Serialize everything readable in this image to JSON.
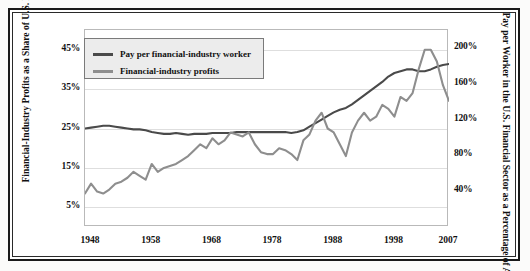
{
  "chart_data": {
    "type": "line",
    "title": "",
    "xlabel": "",
    "ylabel": "Financial-Industry Profits as a Share of U.S. Business Profits",
    "ylabel_right": "Pay per Worker in the U.S. Financial Sector as a Percentage of Average U.S. Compensation",
    "grid": true,
    "legend_position": "top-left",
    "xlim": [
      1947,
      2007
    ],
    "xticks": [
      "1948",
      "1958",
      "1968",
      "1978",
      "1988",
      "1998",
      "2007"
    ],
    "xtick_values": [
      1948,
      1958,
      1968,
      1978,
      1988,
      1998,
      2007
    ],
    "ylim": [
      0,
      50
    ],
    "yticks": [
      "5%",
      "15%",
      "25%",
      "35%",
      "45%"
    ],
    "ytick_values": [
      5,
      15,
      25,
      35,
      45
    ],
    "ylim_right": [
      0,
      220
    ],
    "yticks_right": [
      "40%",
      "80%",
      "120%",
      "160%",
      "200%"
    ],
    "ytick_values_right": [
      40,
      80,
      120,
      160,
      200
    ],
    "series": [
      {
        "name": "Pay per financial-industry worker",
        "axis": "right",
        "color": "#4a4a4a",
        "x": [
          1947,
          1948,
          1949,
          1950,
          1951,
          1952,
          1953,
          1954,
          1955,
          1956,
          1957,
          1958,
          1959,
          1960,
          1961,
          1962,
          1963,
          1964,
          1965,
          1966,
          1967,
          1968,
          1969,
          1970,
          1971,
          1972,
          1973,
          1974,
          1975,
          1976,
          1977,
          1978,
          1979,
          1980,
          1981,
          1982,
          1983,
          1984,
          1985,
          1986,
          1987,
          1988,
          1989,
          1990,
          1991,
          1992,
          1993,
          1994,
          1995,
          1996,
          1997,
          1998,
          1999,
          2000,
          2001,
          2002,
          2003,
          2004,
          2005,
          2006,
          2007
        ],
        "values": [
          110,
          111,
          112,
          113,
          113,
          112,
          111,
          110,
          109,
          109,
          108,
          106,
          105,
          104,
          104,
          105,
          104,
          103,
          104,
          104,
          104,
          105,
          105,
          105,
          105,
          106,
          106,
          106,
          106,
          106,
          106,
          106,
          106,
          106,
          105,
          106,
          108,
          112,
          116,
          120,
          124,
          128,
          131,
          133,
          137,
          142,
          147,
          152,
          157,
          162,
          168,
          172,
          174,
          176,
          176,
          174,
          174,
          176,
          179,
          181,
          182
        ]
      },
      {
        "name": "Financial-industry profits",
        "axis": "left",
        "color": "#8e8e8e",
        "x": [
          1947,
          1948,
          1949,
          1950,
          1951,
          1952,
          1953,
          1954,
          1955,
          1956,
          1957,
          1958,
          1959,
          1960,
          1961,
          1962,
          1963,
          1964,
          1965,
          1966,
          1967,
          1968,
          1969,
          1970,
          1971,
          1972,
          1973,
          1974,
          1975,
          1976,
          1977,
          1978,
          1979,
          1980,
          1981,
          1982,
          1983,
          1984,
          1985,
          1986,
          1987,
          1988,
          1989,
          1990,
          1991,
          1992,
          1993,
          1994,
          1995,
          1996,
          1997,
          1998,
          1999,
          2000,
          2001,
          2002,
          2003,
          2004,
          2005,
          2006,
          2007
        ],
        "values": [
          8.5,
          11,
          9,
          8.5,
          9.5,
          11,
          11.5,
          12.5,
          14,
          13,
          12,
          16,
          14,
          15,
          15.5,
          16,
          17,
          18,
          19.5,
          21,
          20,
          22.5,
          21,
          22,
          24,
          23.5,
          23,
          24,
          21,
          19,
          18.5,
          18.5,
          20,
          19.5,
          18.5,
          17,
          22,
          23.5,
          27,
          29,
          25,
          24,
          21,
          18,
          24,
          27,
          29,
          27,
          28,
          31,
          30,
          28,
          33,
          32,
          34,
          40,
          45,
          45,
          42,
          36,
          32
        ]
      }
    ]
  },
  "legend": {
    "items": [
      {
        "label": "Pay per financial-industry worker",
        "color": "#4a4a4a"
      },
      {
        "label": "Financial-industry profits",
        "color": "#8e8e8e"
      }
    ]
  }
}
